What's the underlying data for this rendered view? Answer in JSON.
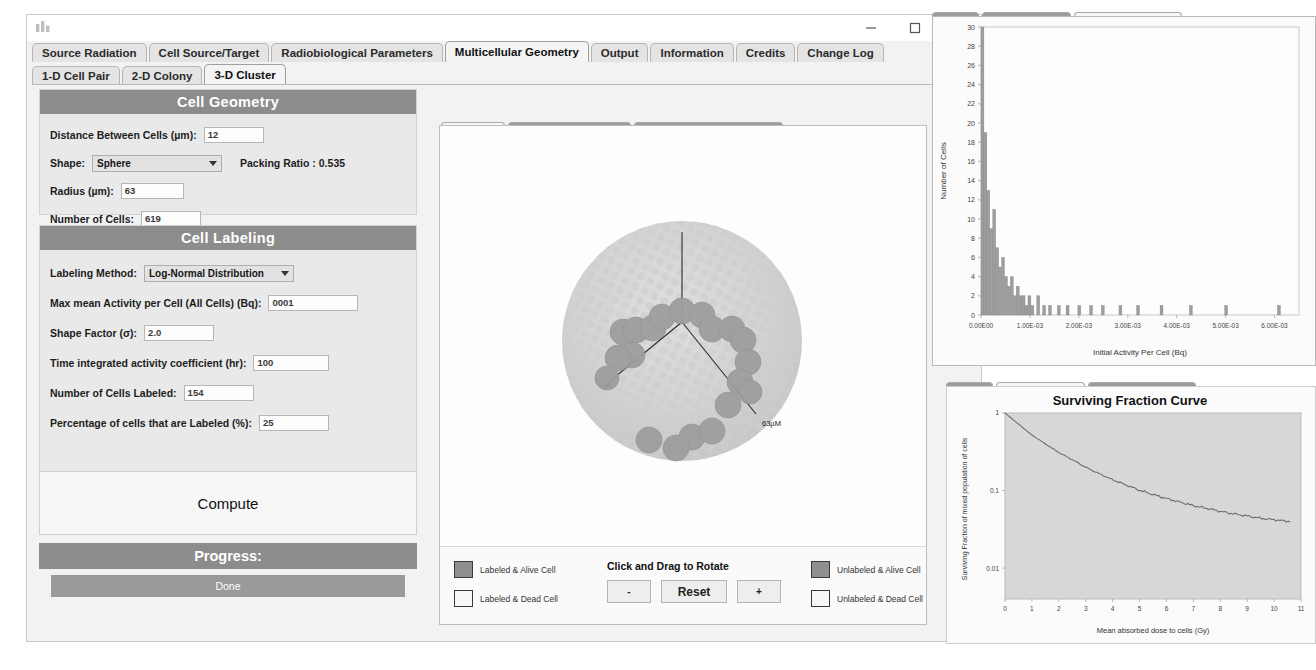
{
  "window": {
    "icon": "app-icon",
    "controls": {
      "minimize": "–",
      "maximize": "□",
      "close": "×"
    }
  },
  "main_tabs": [
    {
      "label": "Source Radiation",
      "selected": false
    },
    {
      "label": "Cell Source/Target",
      "selected": false
    },
    {
      "label": "Radiobiological Parameters",
      "selected": false
    },
    {
      "label": "Multicellular Geometry",
      "selected": true
    },
    {
      "label": "Output",
      "selected": false
    },
    {
      "label": "Information",
      "selected": false
    },
    {
      "label": "Credits",
      "selected": false
    },
    {
      "label": "Change Log",
      "selected": false
    }
  ],
  "sub_tabs": [
    {
      "label": "1-D Cell Pair",
      "selected": false
    },
    {
      "label": "2-D Colony",
      "selected": false
    },
    {
      "label": "3-D Cluster",
      "selected": true
    }
  ],
  "cell_geometry": {
    "title": "Cell Geometry",
    "distance_label": "Distance Between Cells (µm):",
    "distance_value": "12",
    "shape_label": "Shape:",
    "shape_value": "Sphere",
    "packing_ratio": "Packing Ratio : 0.535",
    "radius_label": "Radius (µm):",
    "radius_value": "63",
    "number_of_cells_label": "Number of Cells:",
    "number_of_cells_value": "619"
  },
  "cell_labeling": {
    "title": "Cell Labeling",
    "method_label": "Labeling Method:",
    "method_value": "Log-Normal Distribution",
    "max_activity_label": "Max mean Activity per Cell (All Cells) (Bq):",
    "max_activity_value": "0001",
    "shape_factor_label": "Shape Factor (σ):",
    "shape_factor_value": "2.0",
    "tiac_label": "Time integrated activity coefficient (hr):",
    "tiac_value": "100",
    "cells_labeled_label": "Number of Cells Labeled:",
    "cells_labeled_value": "154",
    "percentage_label": "Percentage of cells that are Labeled (%):",
    "percentage_value": "25"
  },
  "actions": {
    "compute": "Compute",
    "progress": "Progress:",
    "status": "Done"
  },
  "center_panel": {
    "tabs": [
      {
        "label": "3-D Cluster",
        "selected": true
      },
      {
        "label": "Surviving Fraction Curve",
        "selected": false
      },
      {
        "label": "Activity Distribution Histogram",
        "selected": false
      }
    ],
    "axis_label": "63µM",
    "legend": [
      {
        "label": "Labeled & Alive Cell",
        "swatch": "dark"
      },
      {
        "label": "Labeled & Dead Cell",
        "swatch": "light"
      },
      {
        "label": "Unlabeled & Alive Cell",
        "swatch": "dark"
      },
      {
        "label": "Unlabeled & Dead Cell",
        "swatch": "light"
      }
    ],
    "rotate_title": "Click and Drag to Rotate",
    "zoom_out": "-",
    "reset": "Reset",
    "zoom_in": "+"
  },
  "histogram_panel": {
    "tabs": [
      {
        "label": "3-D Cluster",
        "selected": false
      },
      {
        "label": "Surviving Fraction Curve",
        "selected": false
      },
      {
        "label": "Activity Distribution Histogram",
        "selected": true
      }
    ]
  },
  "sfc_panel": {
    "tabs": [
      {
        "label": "3-D Cluster",
        "selected": false
      },
      {
        "label": "Surviving Fraction Curve",
        "selected": true
      },
      {
        "label": "Activity Distribution Histogram",
        "selected": false
      }
    ]
  },
  "chart_data": [
    {
      "type": "bar",
      "id": "activity-distribution-histogram",
      "title": "",
      "xlabel": "Initial Activity Per Cell (Bq)",
      "ylabel": "Number of Cells",
      "xlim": [
        0,
        0.0065
      ],
      "ylim": [
        0,
        30
      ],
      "xticks": [
        "0.00E00",
        "1.00E-03",
        "2.00E-03",
        "3.00E-03",
        "4.00E-03",
        "5.00E-03",
        "6.00E-03"
      ],
      "xtick_values": [
        0,
        0.001,
        0.002,
        0.003,
        0.004,
        0.005,
        0.006
      ],
      "yticks": [
        0,
        2,
        4,
        6,
        8,
        10,
        12,
        14,
        16,
        18,
        20,
        22,
        24,
        26,
        28,
        30
      ],
      "grid": false,
      "legend": "none",
      "bin_width": 6e-05,
      "x": [
        3e-05,
        9e-05,
        0.00015,
        0.00021,
        0.00027,
        0.00033,
        0.00039,
        0.00045,
        0.00051,
        0.00057,
        0.00063,
        0.00069,
        0.00075,
        0.00081,
        0.00087,
        0.00093,
        0.00099,
        0.00105,
        0.00117,
        0.00129,
        0.00141,
        0.00159,
        0.00177,
        0.00201,
        0.00225,
        0.00249,
        0.00285,
        0.00321,
        0.00369,
        0.00429,
        0.00501,
        0.00609
      ],
      "values": [
        30,
        19,
        13,
        9,
        11,
        7,
        5,
        6,
        4,
        3,
        4,
        2,
        3,
        2,
        2,
        1,
        2,
        1,
        2,
        1,
        1,
        1,
        1,
        1,
        1,
        1,
        1,
        1,
        1,
        1,
        1,
        1
      ]
    },
    {
      "type": "line",
      "id": "surviving-fraction-curve",
      "title": "Surviving Fraction Curve",
      "xlabel": "Mean absorbed dose to cells (Gy)",
      "ylabel": "Surviving Fraction of mixed population of cells",
      "xlim": [
        0,
        11
      ],
      "ylim": [
        0.004,
        1
      ],
      "yscale": "log",
      "xticks": [
        0,
        1,
        2,
        3,
        4,
        5,
        6,
        7,
        8,
        9,
        10,
        11
      ],
      "yticks": [
        "1",
        "0.1",
        "0.01"
      ],
      "ytick_values": [
        1,
        0.1,
        0.01
      ],
      "grid": false,
      "legend": "none",
      "x": [
        0,
        0.5,
        1,
        1.5,
        2,
        2.5,
        3,
        3.5,
        4,
        4.5,
        5,
        5.5,
        6,
        6.5,
        7,
        7.5,
        8,
        8.5,
        9,
        9.5,
        10,
        10.6
      ],
      "values": [
        1.0,
        0.72,
        0.52,
        0.4,
        0.31,
        0.25,
        0.2,
        0.165,
        0.138,
        0.118,
        0.101,
        0.089,
        0.079,
        0.071,
        0.064,
        0.059,
        0.054,
        0.05,
        0.047,
        0.044,
        0.042,
        0.04
      ]
    }
  ]
}
